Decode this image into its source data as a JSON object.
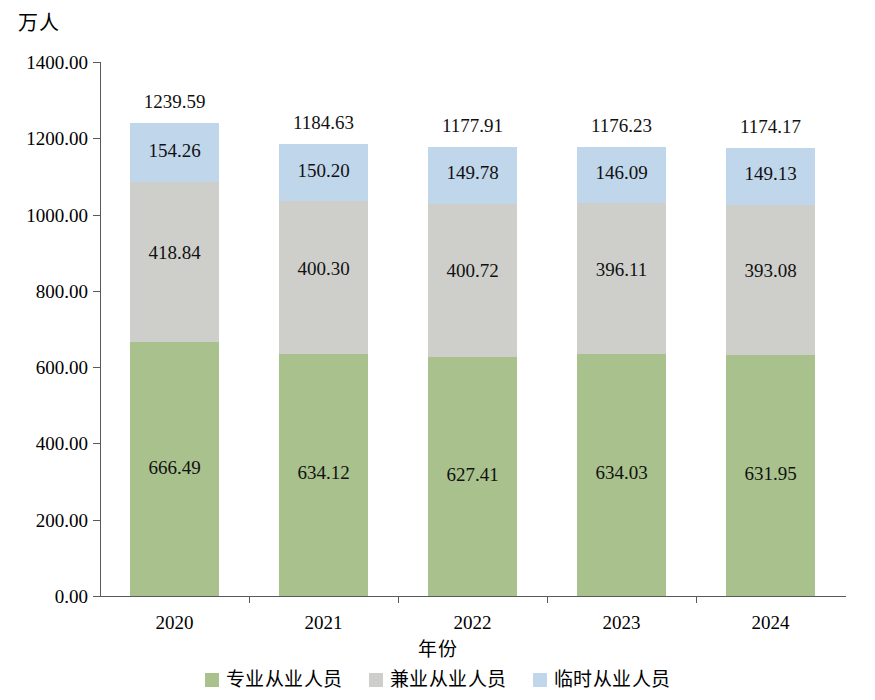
{
  "chart_data": {
    "type": "bar",
    "subtype": "stacked-bar",
    "title": "",
    "unit_label": "万人",
    "xlabel": "年份",
    "ylabel": "",
    "ylim": [
      0,
      1400
    ],
    "ytick_step": 200,
    "ytick_labels": [
      "0.00",
      "200.00",
      "400.00",
      "600.00",
      "800.00",
      "1000.00",
      "1200.00",
      "1400.00"
    ],
    "ytick_values": [
      0,
      200,
      400,
      600,
      800,
      1000,
      1200,
      1400
    ],
    "grid": false,
    "legend_position": "bottom",
    "categories": [
      "2020",
      "2021",
      "2022",
      "2023",
      "2024"
    ],
    "series": [
      {
        "name": "专业从业人员",
        "color": "#a9c18c",
        "values": [
          666.49,
          634.12,
          627.41,
          634.03,
          631.95
        ],
        "labels": [
          "666.49",
          "634.12",
          "627.41",
          "634.03",
          "631.95"
        ]
      },
      {
        "name": "兼业从业人员",
        "color": "#cecfcb",
        "values": [
          418.84,
          400.3,
          400.72,
          396.11,
          393.08
        ],
        "labels": [
          "418.84",
          "400.30",
          "400.72",
          "396.11",
          "393.08"
        ]
      },
      {
        "name": "临时从业人员",
        "color": "#c0d6ea",
        "values": [
          154.26,
          150.2,
          149.78,
          146.09,
          149.13
        ],
        "labels": [
          "154.26",
          "150.20",
          "149.78",
          "146.09",
          "149.13"
        ]
      }
    ],
    "totals": [
      1239.59,
      1184.63,
      1177.91,
      1176.23,
      1174.17
    ],
    "total_labels": [
      "1239.59",
      "1184.63",
      "1177.91",
      "1176.23",
      "1174.17"
    ]
  },
  "legend": {
    "items": [
      {
        "label": "专业从业人员",
        "color": "#a9c18c"
      },
      {
        "label": "兼业从业人员",
        "color": "#cecfcb"
      },
      {
        "label": "临时从业人员",
        "color": "#c0d6ea"
      }
    ]
  }
}
